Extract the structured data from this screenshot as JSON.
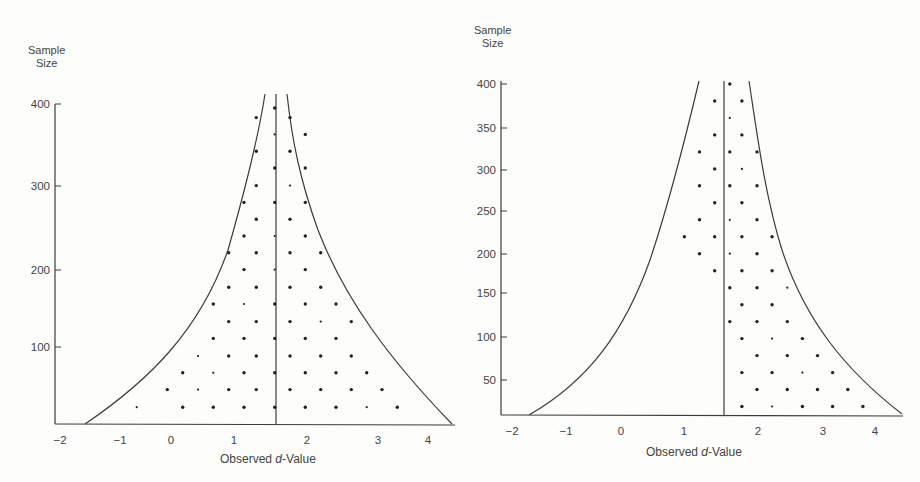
{
  "chart_data": [
    {
      "type": "scatter",
      "subtype": "funnel-plot",
      "title": "",
      "xlabel": "Observed d-Value",
      "xlabel_parts": [
        "Observed ",
        "d",
        "-Value"
      ],
      "ylabel": "Sample Size",
      "ylabel_lines": [
        "Sample",
        "Size"
      ],
      "xlim": [
        -2,
        4.4
      ],
      "ylim": [
        0,
        400
      ],
      "xticks": [
        -2,
        -1,
        0,
        1,
        2,
        3,
        4
      ],
      "yticks": [
        100,
        200,
        300,
        400
      ],
      "grid": false,
      "legend": null,
      "reference_line_x": 1.6,
      "funnel_base_x": [
        -1.55,
        4.35
      ],
      "points": [
        {
          "x": 1.5,
          "y": 395
        },
        {
          "x": 1.2,
          "y": 383
        },
        {
          "x": 1.75,
          "y": 383
        },
        {
          "x": 1.5,
          "y": 362
        },
        {
          "x": 2.0,
          "y": 362
        },
        {
          "x": 1.2,
          "y": 341
        },
        {
          "x": 1.75,
          "y": 341
        },
        {
          "x": 1.5,
          "y": 320
        },
        {
          "x": 2.0,
          "y": 320
        },
        {
          "x": 1.2,
          "y": 298
        },
        {
          "x": 1.75,
          "y": 298
        },
        {
          "x": 1.0,
          "y": 277
        },
        {
          "x": 1.5,
          "y": 277
        },
        {
          "x": 2.0,
          "y": 277
        },
        {
          "x": 1.2,
          "y": 256
        },
        {
          "x": 1.75,
          "y": 256
        },
        {
          "x": 1.0,
          "y": 235
        },
        {
          "x": 1.5,
          "y": 235
        },
        {
          "x": 2.0,
          "y": 235
        },
        {
          "x": 0.75,
          "y": 214
        },
        {
          "x": 1.2,
          "y": 214
        },
        {
          "x": 1.75,
          "y": 214
        },
        {
          "x": 2.25,
          "y": 214
        },
        {
          "x": 1.0,
          "y": 193
        },
        {
          "x": 1.5,
          "y": 193
        },
        {
          "x": 2.0,
          "y": 193
        },
        {
          "x": 0.75,
          "y": 171
        },
        {
          "x": 1.2,
          "y": 171
        },
        {
          "x": 1.75,
          "y": 171
        },
        {
          "x": 2.25,
          "y": 171
        },
        {
          "x": 0.5,
          "y": 150
        },
        {
          "x": 1.0,
          "y": 150
        },
        {
          "x": 1.5,
          "y": 150
        },
        {
          "x": 2.0,
          "y": 150
        },
        {
          "x": 2.5,
          "y": 150
        },
        {
          "x": 0.75,
          "y": 128
        },
        {
          "x": 1.2,
          "y": 128
        },
        {
          "x": 1.75,
          "y": 128
        },
        {
          "x": 2.25,
          "y": 128
        },
        {
          "x": 2.75,
          "y": 128
        },
        {
          "x": 0.5,
          "y": 107
        },
        {
          "x": 1.0,
          "y": 107
        },
        {
          "x": 1.5,
          "y": 107
        },
        {
          "x": 2.0,
          "y": 107
        },
        {
          "x": 2.5,
          "y": 107
        },
        {
          "x": 0.25,
          "y": 85
        },
        {
          "x": 0.75,
          "y": 85
        },
        {
          "x": 1.2,
          "y": 85
        },
        {
          "x": 1.75,
          "y": 85
        },
        {
          "x": 2.25,
          "y": 85
        },
        {
          "x": 2.75,
          "y": 85
        },
        {
          "x": 0.0,
          "y": 64
        },
        {
          "x": 0.5,
          "y": 64
        },
        {
          "x": 1.0,
          "y": 64
        },
        {
          "x": 1.5,
          "y": 64
        },
        {
          "x": 2.0,
          "y": 64
        },
        {
          "x": 2.5,
          "y": 64
        },
        {
          "x": 3.0,
          "y": 64
        },
        {
          "x": -0.25,
          "y": 43
        },
        {
          "x": 0.25,
          "y": 43
        },
        {
          "x": 0.75,
          "y": 43
        },
        {
          "x": 1.2,
          "y": 43
        },
        {
          "x": 1.75,
          "y": 43
        },
        {
          "x": 2.25,
          "y": 43
        },
        {
          "x": 2.75,
          "y": 43
        },
        {
          "x": 3.25,
          "y": 43
        },
        {
          "x": -0.75,
          "y": 21
        },
        {
          "x": 0.0,
          "y": 21
        },
        {
          "x": 0.5,
          "y": 21
        },
        {
          "x": 1.0,
          "y": 21
        },
        {
          "x": 1.5,
          "y": 21
        },
        {
          "x": 2.0,
          "y": 21
        },
        {
          "x": 2.5,
          "y": 21
        },
        {
          "x": 3.0,
          "y": 21
        },
        {
          "x": 3.5,
          "y": 21
        }
      ]
    },
    {
      "type": "scatter",
      "subtype": "funnel-plot",
      "title": "",
      "xlabel": "Observed d-Value",
      "xlabel_parts": [
        "Observed ",
        "d",
        "-Value"
      ],
      "ylabel": "Sample Size",
      "ylabel_lines": [
        "Sample",
        "Size"
      ],
      "xlim": [
        -2,
        4.4
      ],
      "ylim": [
        10,
        400
      ],
      "xticks": [
        -2,
        -1,
        0,
        1,
        2,
        3,
        4
      ],
      "yticks": [
        50,
        100,
        150,
        200,
        250,
        300,
        350,
        400
      ],
      "grid": false,
      "legend": null,
      "reference_line_x": 1.6,
      "funnel_base_x": [
        -1.7,
        4.4
      ],
      "points": [
        {
          "x": 1.6,
          "y": 400
        },
        {
          "x": 1.35,
          "y": 380
        },
        {
          "x": 1.8,
          "y": 380
        },
        {
          "x": 1.6,
          "y": 360
        },
        {
          "x": 1.35,
          "y": 340
        },
        {
          "x": 1.8,
          "y": 340
        },
        {
          "x": 1.1,
          "y": 320
        },
        {
          "x": 1.6,
          "y": 320
        },
        {
          "x": 2.05,
          "y": 320
        },
        {
          "x": 1.35,
          "y": 300
        },
        {
          "x": 1.8,
          "y": 300
        },
        {
          "x": 1.1,
          "y": 280
        },
        {
          "x": 1.6,
          "y": 280
        },
        {
          "x": 2.05,
          "y": 280
        },
        {
          "x": 1.35,
          "y": 260
        },
        {
          "x": 1.8,
          "y": 260
        },
        {
          "x": 1.1,
          "y": 240
        },
        {
          "x": 1.6,
          "y": 240
        },
        {
          "x": 2.05,
          "y": 240
        },
        {
          "x": 0.85,
          "y": 220
        },
        {
          "x": 1.35,
          "y": 220
        },
        {
          "x": 1.8,
          "y": 220
        },
        {
          "x": 2.3,
          "y": 220
        },
        {
          "x": 1.1,
          "y": 200
        },
        {
          "x": 1.6,
          "y": 200
        },
        {
          "x": 2.05,
          "y": 200
        },
        {
          "x": 1.35,
          "y": 180
        },
        {
          "x": 1.8,
          "y": 180
        },
        {
          "x": 2.3,
          "y": 180
        },
        {
          "x": 1.6,
          "y": 160
        },
        {
          "x": 2.05,
          "y": 160
        },
        {
          "x": 2.55,
          "y": 160
        },
        {
          "x": 1.8,
          "y": 140
        },
        {
          "x": 2.3,
          "y": 140
        },
        {
          "x": 1.6,
          "y": 120
        },
        {
          "x": 2.05,
          "y": 120
        },
        {
          "x": 2.55,
          "y": 120
        },
        {
          "x": 1.8,
          "y": 100
        },
        {
          "x": 2.3,
          "y": 100
        },
        {
          "x": 2.8,
          "y": 100
        },
        {
          "x": 2.05,
          "y": 80
        },
        {
          "x": 2.55,
          "y": 80
        },
        {
          "x": 3.05,
          "y": 80
        },
        {
          "x": 1.8,
          "y": 60
        },
        {
          "x": 2.3,
          "y": 60
        },
        {
          "x": 2.8,
          "y": 60
        },
        {
          "x": 3.3,
          "y": 60
        },
        {
          "x": 2.05,
          "y": 40
        },
        {
          "x": 2.55,
          "y": 40
        },
        {
          "x": 3.05,
          "y": 40
        },
        {
          "x": 3.55,
          "y": 40
        },
        {
          "x": 1.8,
          "y": 20
        },
        {
          "x": 2.3,
          "y": 20
        },
        {
          "x": 2.8,
          "y": 20
        },
        {
          "x": 3.3,
          "y": 20
        },
        {
          "x": 3.8,
          "y": 20
        }
      ]
    }
  ],
  "panels": [
    {
      "ylabel_top": "Sample",
      "ylabel_bottom": "Size",
      "xlabel_pre": "Observed ",
      "xlabel_ital": "d",
      "xlabel_post": "-Value",
      "geom": {
        "axisX": 55,
        "axisTop": 104,
        "baseY": 424,
        "axisRight": 455,
        "xmap": {
          "x0": -2,
          "px0": 60,
          "x1": 4,
          "px1": 428
        },
        "ymap": {
          "y0": 0,
          "py0": 424,
          "y1": 400,
          "py1": 104
        },
        "centerPx": 276,
        "centerTop": 94,
        "leftCurve": "M85,424 C150,380 200,330 228,250 C245,190 258,140 265,94",
        "rightCurve": "M452,424 C390,360 345,300 318,230 C300,180 292,140 287,94",
        "yticks": [
          {
            "v": "400",
            "py": 104
          },
          {
            "v": "300",
            "py": 186
          },
          {
            "v": "200",
            "py": 270
          },
          {
            "v": "100",
            "py": 347
          }
        ],
        "xticks": [
          {
            "v": "−2",
            "px": 60
          },
          {
            "v": "−1",
            "px": 120
          },
          {
            "v": "0",
            "px": 171
          },
          {
            "v": "1",
            "px": 234
          },
          {
            "v": "2",
            "px": 307
          },
          {
            "v": "3",
            "px": 378
          },
          {
            "v": "4",
            "px": 428
          }
        ],
        "ylabelPos": {
          "left": 28,
          "top": 44
        },
        "xlabelPos": {
          "left": 220,
          "top": 452
        }
      }
    },
    {
      "ylabel_top": "Sample",
      "ylabel_bottom": "Size",
      "xlabel_pre": "Observed ",
      "xlabel_ital": "d",
      "xlabel_post": "-Value",
      "geom": {
        "axisX": 41,
        "axisTop": 81,
        "baseY": 415,
        "axisRight": 443,
        "xmap": {
          "x0": -2,
          "px0": 52,
          "x1": 4,
          "px1": 415
        },
        "ymap": {
          "y0": 10,
          "py0": 415,
          "y1": 400,
          "py1": 84
        },
        "centerPx": 264,
        "centerTop": 81,
        "leftCurve": "M69,415 C130,380 165,330 190,260 C210,200 225,140 239,81",
        "rightCurve": "M442,414 C385,370 345,320 322,250 C305,195 298,140 289,81",
        "yticks": [
          {
            "v": "400",
            "py": 84
          },
          {
            "v": "350",
            "py": 128
          },
          {
            "v": "300",
            "py": 170
          },
          {
            "v": "250",
            "py": 211
          },
          {
            "v": "200",
            "py": 254
          },
          {
            "v": "150",
            "py": 293
          },
          {
            "v": "100",
            "py": 337
          },
          {
            "v": "50",
            "py": 380
          }
        ],
        "xticks": [
          {
            "v": "−2",
            "px": 52
          },
          {
            "v": "−1",
            "px": 106
          },
          {
            "v": "0",
            "px": 161
          },
          {
            "v": "1",
            "px": 224
          },
          {
            "v": "2",
            "px": 298
          },
          {
            "v": "3",
            "px": 363
          },
          {
            "v": "4",
            "px": 415
          }
        ],
        "ylabelPos": {
          "left": 14,
          "top": 24
        },
        "xlabelPos": {
          "left": 186,
          "top": 445
        }
      }
    }
  ],
  "colors": {
    "ink": "#3c3c3c",
    "background": "#fdfdfb"
  }
}
